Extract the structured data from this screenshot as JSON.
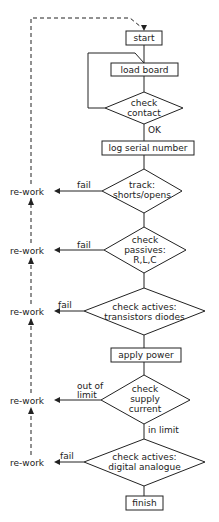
{
  "diagram": {
    "type": "flowchart",
    "nodes": {
      "start": "start",
      "load_board": "load board",
      "check_contact_1": "check",
      "check_contact_2": "contact",
      "log_serial": "log serial number",
      "track_1": "track:",
      "track_2": "shorts/opens",
      "passives_1": "check",
      "passives_2": "passives:",
      "passives_3": "R,L,C",
      "actives_1": "check actives:",
      "actives_2": "transistors diodes",
      "apply_power": "apply power",
      "supply_1": "check",
      "supply_2": "supply",
      "supply_3": "current",
      "digital_1": "check actives:",
      "digital_2": "digital analogue",
      "finish": "finish"
    },
    "edge_labels": {
      "ok": "OK",
      "fail": "fail",
      "out_of_1": "out of",
      "out_of_2": "limit",
      "in_limit": "in limit"
    },
    "rework": "re-work"
  }
}
